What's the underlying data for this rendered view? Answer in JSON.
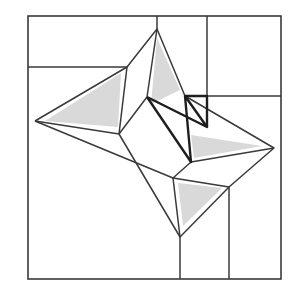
{
  "colors": {
    "stroke": "#3a3a3a",
    "thick_stroke": "#1e1e1e",
    "fill": "#d9d9d9",
    "background": "#ffffff"
  },
  "outer_square": {
    "x1": 28,
    "y1": 16,
    "x2": 281,
    "y2": 279
  },
  "shaded_triangles": [
    {
      "name": "left-triangle",
      "points": "45,121 121,73 118,127"
    },
    {
      "name": "top-triangle",
      "points": "157,38 180,90 151,104"
    },
    {
      "name": "right-triangle",
      "points": "191,135 262,146 194,158"
    },
    {
      "name": "bottom-triangle",
      "points": "178,183 222,188 183,226"
    }
  ],
  "thin_lines": [
    {
      "name": "top-split-vertical-1",
      "pts": "157,16 157,29"
    },
    {
      "name": "top-split-vertical-2",
      "pts": "207,16 207,127"
    },
    {
      "name": "left-horizontal",
      "pts": "28,67 127,67"
    },
    {
      "name": "right-horizontal",
      "pts": "185,96 281,96"
    },
    {
      "name": "outer-shape",
      "pts": "35,121 127,67 157,29 185,96 274,148 229,187 180,237 119,134 35,121"
    },
    {
      "name": "left-to-bottom",
      "pts": "35,121 173,178 180,237"
    },
    {
      "name": "inner-left",
      "pts": "127,67 119,134"
    },
    {
      "name": "inner-top",
      "pts": "157,29 147,97 119,134"
    },
    {
      "name": "inner-right",
      "pts": "274,148 191,162 173,178 229,187"
    },
    {
      "name": "bottom-vertical-1",
      "pts": "180,237 180,279"
    },
    {
      "name": "bottom-vertical-2",
      "pts": "229,187 229,279"
    }
  ],
  "thick_lines": [
    {
      "name": "zigzag",
      "pts": "147,97 207,127 185,96 191,162 147,97"
    },
    {
      "name": "small-rect",
      "pts": "185,96 207,96 207,127"
    }
  ]
}
